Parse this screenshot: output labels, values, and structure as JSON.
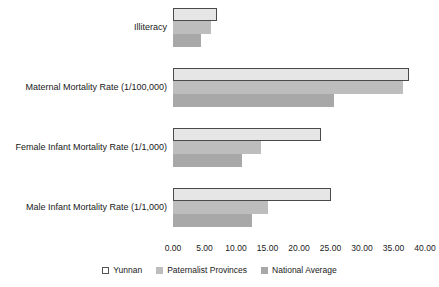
{
  "chart_data": {
    "type": "bar",
    "orientation": "horizontal",
    "title": "",
    "xlabel": "",
    "ylabel": "",
    "grid": false,
    "legend_position": "bottom",
    "xlim": [
      0,
      40
    ],
    "xticks": [
      "0.00",
      "5.00",
      "10.00",
      "15.00",
      "20.00",
      "25.00",
      "30.00",
      "35.00",
      "40.00"
    ],
    "xtick_values": [
      0,
      5,
      10,
      15,
      20,
      25,
      30,
      35,
      40
    ],
    "categories": [
      "Illiteracy",
      "Maternal Mortality Rate (1/100,000)",
      "Female Infant Mortality Rate (1/1,000)",
      "Male Infant Mortality Rate (1/1,000)"
    ],
    "series": [
      {
        "name": "Yunnan",
        "color": "#e6e6e6",
        "values": [
          7.0,
          37.5,
          23.5,
          25.0
        ]
      },
      {
        "name": "Paternalist Provinces",
        "color": "#bdbdbd",
        "values": [
          6.0,
          36.5,
          14.0,
          15.0
        ]
      },
      {
        "name": "National Average",
        "color": "#a8a8a8",
        "values": [
          4.5,
          25.5,
          11.0,
          12.5
        ]
      }
    ]
  }
}
